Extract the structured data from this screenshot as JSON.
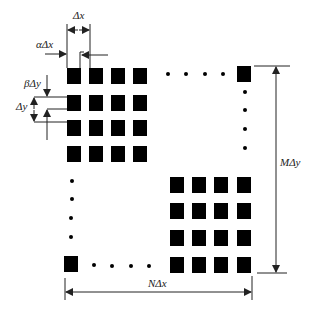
{
  "diagram": {
    "type": "periodic rectangular aperture array schematic",
    "colors": {
      "element": "#000000",
      "line": "#222222",
      "background": "#ffffff"
    },
    "labels": {
      "delta_x": "Δx",
      "alpha_delta_x": "αΔx",
      "beta_delta_y": "βΔy",
      "delta_y": "Δy",
      "m_delta_y": "MΔy",
      "n_delta_x": "NΔx"
    },
    "top_left_grid": {
      "rows": 4,
      "cols": 4
    },
    "bottom_right_grid": {
      "rows": 4,
      "cols": 4
    },
    "corner_elements": [
      "top-right",
      "bottom-left"
    ],
    "ellipsis_dots": {
      "top_row": 4,
      "right_column": 4,
      "left_column": 4,
      "bottom_row": 4
    }
  }
}
